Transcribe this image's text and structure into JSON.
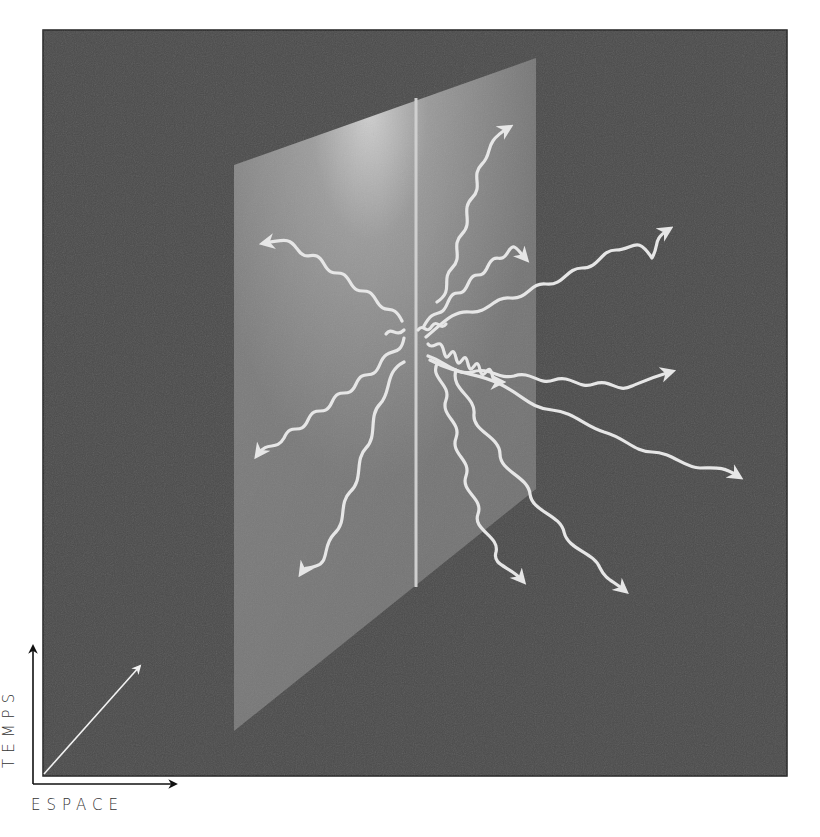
{
  "diagram": {
    "axes": {
      "x_label": "ESPACE",
      "y_label": "TEMPS"
    },
    "colors": {
      "background_frame": "#4a4a4a",
      "plane": "#8c8c8c",
      "plane_highlight": "#d8d8d8",
      "waves": "#e6e6e6",
      "axis_ink": "#111111"
    },
    "elements": {
      "frame": "dark spacetime square",
      "plane": "translucent brane (plane) seen in perspective",
      "worldline": "vertical line on the plane",
      "waves": "wavy arrows radiating from a point on the worldline",
      "depth_arrow": "diagonal arrow indicating third dimension"
    },
    "wave_count": 13
  }
}
